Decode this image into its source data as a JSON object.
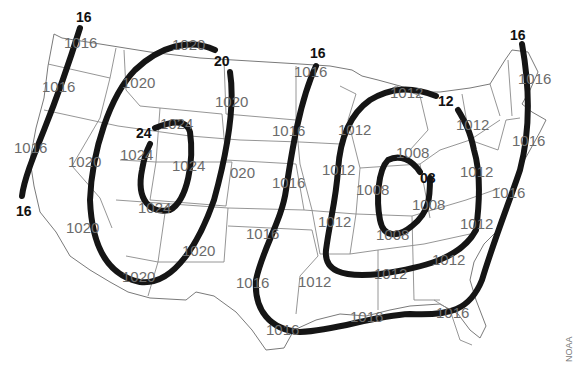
{
  "map": {
    "title": "Surface pressure map (isobars, mb)",
    "credit": "NOAA",
    "colors": {
      "isobar": "#151515",
      "station_text": "#6b6b6b",
      "borders": "#8a8a8a"
    },
    "isobar_labels": [
      {
        "text": "16",
        "x": 76,
        "y": 22
      },
      {
        "text": "16",
        "x": 16,
        "y": 216
      },
      {
        "text": "20",
        "x": 214,
        "y": 66
      },
      {
        "text": "24",
        "x": 136,
        "y": 138
      },
      {
        "text": "16",
        "x": 310,
        "y": 58
      },
      {
        "text": "12",
        "x": 438,
        "y": 106
      },
      {
        "text": "08",
        "x": 420,
        "y": 183
      },
      {
        "text": "16",
        "x": 510,
        "y": 40
      }
    ],
    "station_values": [
      {
        "text": "1016",
        "x": 64,
        "y": 48
      },
      {
        "text": "1016",
        "x": 42,
        "y": 92
      },
      {
        "text": "1016",
        "x": 14,
        "y": 153
      },
      {
        "text": "1020",
        "x": 172,
        "y": 50
      },
      {
        "text": "1020",
        "x": 122,
        "y": 88
      },
      {
        "text": "1020",
        "x": 215,
        "y": 107
      },
      {
        "text": "1024",
        "x": 160,
        "y": 129
      },
      {
        "text": "1024",
        "x": 120,
        "y": 160
      },
      {
        "text": "1024",
        "x": 172,
        "y": 171
      },
      {
        "text": "020",
        "x": 230,
        "y": 178
      },
      {
        "text": "1020",
        "x": 68,
        "y": 167
      },
      {
        "text": "1024",
        "x": 138,
        "y": 213
      },
      {
        "text": "1020",
        "x": 66,
        "y": 233
      },
      {
        "text": "1020",
        "x": 182,
        "y": 256
      },
      {
        "text": "1020",
        "x": 122,
        "y": 282
      },
      {
        "text": "1016",
        "x": 294,
        "y": 77
      },
      {
        "text": "1016",
        "x": 272,
        "y": 136
      },
      {
        "text": "1016",
        "x": 272,
        "y": 188
      },
      {
        "text": "1016",
        "x": 246,
        "y": 239
      },
      {
        "text": "1016",
        "x": 236,
        "y": 288
      },
      {
        "text": "1012",
        "x": 338,
        "y": 135
      },
      {
        "text": "1012",
        "x": 322,
        "y": 175
      },
      {
        "text": "1012",
        "x": 390,
        "y": 98
      },
      {
        "text": "1012",
        "x": 456,
        "y": 130
      },
      {
        "text": "1008",
        "x": 396,
        "y": 158
      },
      {
        "text": "1008",
        "x": 356,
        "y": 195
      },
      {
        "text": "1008",
        "x": 412,
        "y": 210
      },
      {
        "text": "1008",
        "x": 376,
        "y": 240
      },
      {
        "text": "1012",
        "x": 318,
        "y": 227
      },
      {
        "text": "1012",
        "x": 298,
        "y": 287
      },
      {
        "text": "1012",
        "x": 460,
        "y": 177
      },
      {
        "text": "1012",
        "x": 460,
        "y": 229
      },
      {
        "text": "1012",
        "x": 374,
        "y": 279
      },
      {
        "text": "1012",
        "x": 432,
        "y": 265
      },
      {
        "text": "1016",
        "x": 518,
        "y": 84
      },
      {
        "text": "1016",
        "x": 512,
        "y": 146
      },
      {
        "text": "1016",
        "x": 492,
        "y": 198
      },
      {
        "text": "1016",
        "x": 350,
        "y": 322
      },
      {
        "text": "1016",
        "x": 436,
        "y": 318
      },
      {
        "text": "1016",
        "x": 266,
        "y": 335
      }
    ]
  }
}
